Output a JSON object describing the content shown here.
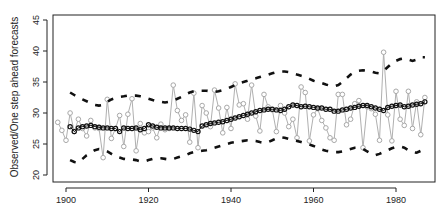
{
  "chart_data": {
    "type": "line",
    "title": "",
    "xlabel": "",
    "ylabel": "Observed/One step ahead forecasts",
    "xlim": [
      1897,
      1990
    ],
    "ylim": [
      20,
      45
    ],
    "x_ticks": [
      1900,
      1920,
      1940,
      1960,
      1980
    ],
    "y_ticks": [
      20,
      25,
      30,
      35,
      40,
      45
    ],
    "grid": false,
    "legend": null,
    "x_start": 1898,
    "series": [
      {
        "name": "Observed",
        "style": "gray line with open circles",
        "color": "#a0a0a0",
        "start_year": 1898,
        "values": [
          28.5,
          27.2,
          25.6,
          30.0,
          27.0,
          29.0,
          27.5,
          26.3,
          28.8,
          27.6,
          27.5,
          22.8,
          32.2,
          25.9,
          27.5,
          29.6,
          24.6,
          29.8,
          32.3,
          23.9,
          28.3,
          26.8,
          27.0,
          27.6,
          26.0,
          28.2,
          27.3,
          27.5,
          34.5,
          30.4,
          28.8,
          29.7,
          25.3,
          33.2,
          24.4,
          31.2,
          30.0,
          27.8,
          33.7,
          30.8,
          26.8,
          30.9,
          27.5,
          34.7,
          31.3,
          31.5,
          29.0,
          34.5,
          29.5,
          27.1,
          33.0,
          31.0,
          30.5,
          27.0,
          31.2,
          30.0,
          27.8,
          29.0,
          26.0,
          34.2,
          33.3,
          25.5,
          29.7,
          30.7,
          28.8,
          27.6,
          26.0,
          25.6,
          33.0,
          33.0,
          28.1,
          29.0,
          31.5,
          32.0,
          24.4,
          31.0,
          30.7,
          29.8,
          25.6,
          39.8,
          29.7,
          25.5,
          33.5,
          29.0,
          28.0,
          33.5,
          27.5,
          31.8,
          26.5,
          32.5
        ]
      },
      {
        "name": "One step ahead forecast",
        "style": "black line with open circles",
        "color": "#111111",
        "start_year": 1901,
        "values": [
          27.8,
          27.0,
          27.6,
          27.8,
          27.9,
          28.0,
          27.8,
          27.7,
          27.6,
          27.6,
          27.5,
          27.5,
          27.0,
          27.6,
          27.5,
          27.5,
          27.6,
          27.3,
          27.5,
          28.1,
          27.9,
          27.7,
          27.6,
          27.6,
          27.6,
          27.6,
          27.5,
          27.5,
          27.5,
          27.4,
          27.2,
          27.0,
          27.9,
          28.1,
          28.3,
          28.4,
          28.5,
          28.6,
          28.8,
          29.0,
          29.2,
          29.4,
          29.6,
          29.8,
          30.0,
          30.2,
          30.4,
          30.5,
          30.6,
          30.6,
          30.5,
          30.4,
          30.6,
          31.0,
          31.3,
          31.2,
          31.0,
          31.1,
          31.0,
          30.9,
          30.8,
          30.8,
          30.6,
          30.6,
          30.3,
          30.3,
          30.5,
          30.6,
          30.8,
          30.9,
          31.1,
          31.2,
          31.2,
          31.0,
          30.8,
          30.6,
          30.4,
          30.9,
          31.1,
          31.2,
          31.3,
          31.0,
          31.1,
          31.3,
          31.4,
          31.5,
          31.8
        ]
      },
      {
        "name": "Upper bound",
        "style": "thick black dashed",
        "color": "#111111",
        "start_year": 1901,
        "values": [
          33.3,
          32.9,
          32.5,
          32.2,
          31.9,
          31.6,
          31.3,
          31.2,
          31.3,
          31.8,
          32.2,
          32.4,
          32.6,
          32.7,
          32.8,
          32.8,
          32.8,
          32.7,
          32.5,
          32.3,
          32.1,
          31.9,
          31.8,
          31.7,
          31.8,
          32.0,
          32.3,
          32.6,
          33.0,
          33.3,
          33.5,
          33.6,
          33.6,
          33.6,
          33.5,
          33.4,
          33.5,
          33.7,
          33.9,
          34.2,
          34.5,
          34.8,
          35.0,
          35.2,
          35.4,
          35.6,
          35.8,
          36.0,
          36.2,
          36.4,
          36.6,
          36.7,
          36.7,
          36.6,
          36.4,
          36.2,
          36.0,
          35.8,
          35.5,
          35.2,
          35.0,
          34.8,
          34.6,
          34.4,
          34.3,
          34.5,
          35.0,
          35.6,
          36.2,
          36.6,
          36.8,
          36.9,
          36.8,
          36.7,
          36.5,
          36.4,
          36.8,
          37.4,
          38.0,
          38.4,
          38.7,
          38.8,
          38.6,
          38.4,
          38.6,
          39.0,
          39.0
        ]
      },
      {
        "name": "Lower bound",
        "style": "thick black dashed",
        "color": "#111111",
        "start_year": 1901,
        "values": [
          22.4,
          22.1,
          22.0,
          22.6,
          23.2,
          23.6,
          24.0,
          24.2,
          24.1,
          23.8,
          23.4,
          23.0,
          22.8,
          22.6,
          22.5,
          22.5,
          22.4,
          22.2,
          22.2,
          22.4,
          22.6,
          22.7,
          22.7,
          22.6,
          22.5,
          22.6,
          22.8,
          23.0,
          23.2,
          23.5,
          23.7,
          23.8,
          23.9,
          24.0,
          24.2,
          24.4,
          24.6,
          24.8,
          25.0,
          25.2,
          25.3,
          25.4,
          25.5,
          25.6,
          25.6,
          25.5,
          25.3,
          25.2,
          25.3,
          25.6,
          25.9,
          26.1,
          26.0,
          25.8,
          25.6,
          25.5,
          25.3,
          25.1,
          24.9,
          24.7,
          24.4,
          24.1,
          23.9,
          23.8,
          23.7,
          23.7,
          23.8,
          24.0,
          24.2,
          24.4,
          24.4,
          24.2,
          23.8,
          23.4,
          23.2,
          23.4,
          23.7,
          24.0,
          24.3,
          24.5,
          24.6,
          24.4,
          24.0,
          23.7,
          23.6,
          23.9,
          24.2
        ]
      }
    ]
  }
}
